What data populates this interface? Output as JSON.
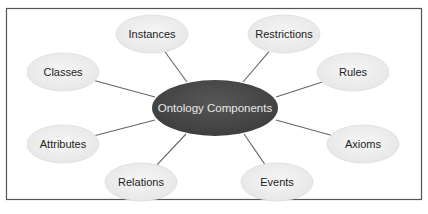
{
  "diagram": {
    "center": {
      "label": "Ontology Components",
      "cx": 215,
      "cy": 108,
      "rx": 63,
      "ry": 28,
      "fill": "#4a4a4a"
    },
    "nodes": [
      {
        "label": "Instances",
        "cx": 152,
        "cy": 34,
        "lx": 187,
        "ly": 82
      },
      {
        "label": "Restrictions",
        "cx": 284,
        "cy": 34,
        "lx": 243,
        "ly": 82
      },
      {
        "label": "Classes",
        "cx": 63,
        "cy": 72,
        "lx": 155,
        "ly": 97
      },
      {
        "label": "Rules",
        "cx": 353,
        "cy": 72,
        "lx": 276,
        "ly": 97
      },
      {
        "label": "Attributes",
        "cx": 63,
        "cy": 144,
        "lx": 155,
        "ly": 120
      },
      {
        "label": "Axioms",
        "cx": 363,
        "cy": 144,
        "lx": 276,
        "ly": 120
      },
      {
        "label": "Relations",
        "cx": 141,
        "cy": 182,
        "lx": 186,
        "ly": 134
      },
      {
        "label": "Events",
        "cx": 277,
        "cy": 182,
        "lx": 244,
        "ly": 134
      }
    ],
    "node_rx": 36,
    "node_ry": 19,
    "node_fill": "#eeeeee",
    "node_stroke": "#dddddd",
    "line_color": "#666666",
    "frame_color": "#555555"
  }
}
